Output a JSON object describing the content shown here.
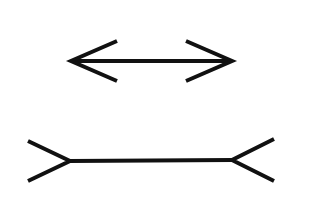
{
  "figure": {
    "title": "Müller-Lyer illusion",
    "stroke_color": "#111111",
    "background": "#ffffff",
    "stroke_width": 4,
    "figures": [
      {
        "name": "arrowheads-inward (fins pointing out)",
        "shaft": {
          "x1": 72,
          "y1": 61,
          "x2": 231,
          "y2": 61
        },
        "left_head": [
          [
            117,
            41
          ],
          [
            71,
            61
          ],
          [
            117,
            81
          ]
        ],
        "right_head": [
          [
            186,
            41
          ],
          [
            232,
            61
          ],
          [
            186,
            81
          ]
        ]
      },
      {
        "name": "arrowheads-outward (fins pointing in)",
        "shaft": {
          "x1": 70,
          "y1": 161,
          "x2": 232,
          "y2": 160
        },
        "left_fin": [
          [
            28,
            141
          ],
          [
            70,
            161
          ],
          [
            28,
            181
          ]
        ],
        "right_fin": [
          [
            274,
            139
          ],
          [
            232,
            160
          ],
          [
            274,
            181
          ]
        ]
      }
    ]
  }
}
